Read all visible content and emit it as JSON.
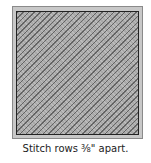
{
  "figure": {
    "caption": "Stitch rows ⅜\" apart.",
    "colors": {
      "binding": "#c8c8c8",
      "quilt": "#a9a9a9",
      "border": "#222222"
    }
  }
}
